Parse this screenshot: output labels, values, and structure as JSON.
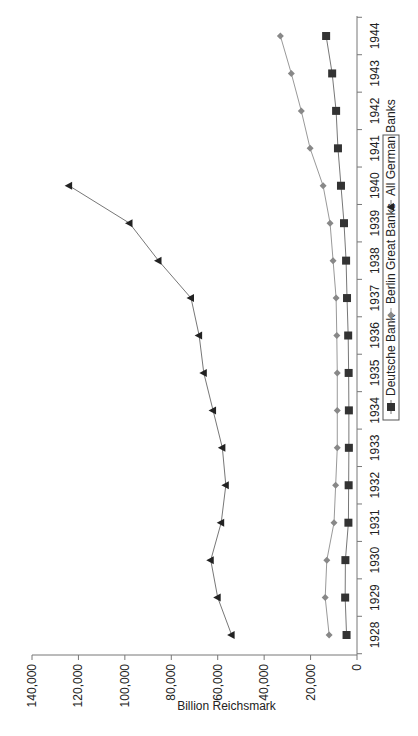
{
  "chart_data": {
    "type": "line",
    "title": "",
    "xlabel": "",
    "ylabel": "Billion Reichsmark",
    "orientation": "rotated -90 degrees",
    "ylim": [
      0,
      140000
    ],
    "y_ticks": [
      "0",
      "20,000",
      "40,000",
      "60,000",
      "80,000",
      "100,000",
      "120,000",
      "140,000"
    ],
    "y_tick_values": [
      0,
      20000,
      40000,
      60000,
      80000,
      100000,
      120000,
      140000
    ],
    "categories": [
      "1928",
      "1929",
      "1930",
      "1931",
      "1932",
      "1933",
      "1934",
      "1935",
      "1936",
      "1937",
      "1938",
      "1939",
      "1940",
      "1941",
      "1942",
      "1943",
      "1944"
    ],
    "grid": false,
    "legend_position": "top (right side when rotated)",
    "series": [
      {
        "name": "Deutsche Bank",
        "marker": "square",
        "color": "#333333",
        "line_color": "#777777",
        "values": [
          4500,
          5100,
          5000,
          3700,
          3600,
          3500,
          3500,
          3600,
          3800,
          4300,
          4700,
          5600,
          6900,
          8200,
          9000,
          10700,
          13300
        ]
      },
      {
        "name": "Berlin Great Banks",
        "marker": "diamond",
        "color": "#888888",
        "line_color": "#999999",
        "values": [
          12000,
          13700,
          13000,
          9900,
          9200,
          8500,
          8500,
          8500,
          8700,
          9000,
          10300,
          11600,
          14600,
          20200,
          24000,
          28300,
          33000
        ]
      },
      {
        "name": "All German Banks",
        "marker": "triangle",
        "color": "#222222",
        "line_color": "#777777",
        "values": [
          54000,
          60000,
          63000,
          58500,
          56500,
          58000,
          62000,
          66000,
          68000,
          71500,
          85500,
          98000,
          124000,
          null,
          null,
          null,
          null
        ]
      }
    ]
  }
}
